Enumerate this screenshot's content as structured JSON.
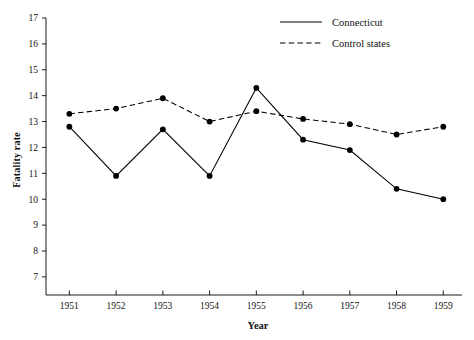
{
  "chart_data": {
    "type": "line",
    "title": "",
    "xlabel": "Year",
    "ylabel": "Fatality rate",
    "categories": [
      "1951",
      "1952",
      "1953",
      "1954",
      "1955",
      "1956",
      "1957",
      "1958",
      "1959"
    ],
    "x": [
      1951,
      1952,
      1953,
      1954,
      1955,
      1956,
      1957,
      1958,
      1959
    ],
    "xlim": [
      1950.5,
      1959.4
    ],
    "ylim": [
      6.3,
      17
    ],
    "yticks": [
      7,
      8,
      9,
      10,
      11,
      12,
      13,
      14,
      15,
      16,
      17
    ],
    "ytick_labels": [
      "7",
      "8",
      "9",
      "10",
      "11",
      "12",
      "13",
      "14",
      "15",
      "16",
      "17"
    ],
    "grid": false,
    "legend_position": "top-right",
    "series": [
      {
        "name": "Connecticut",
        "style": "solid",
        "marker": "filled-circle",
        "color": "#000000",
        "values": [
          12.8,
          10.9,
          12.7,
          10.9,
          14.3,
          12.3,
          11.9,
          10.4,
          10.0
        ]
      },
      {
        "name": "Control states",
        "style": "dashed",
        "marker": "filled-circle",
        "color": "#000000",
        "values": [
          13.3,
          13.5,
          13.9,
          13.0,
          13.4,
          13.1,
          12.9,
          12.5,
          12.8
        ]
      }
    ]
  },
  "legend": {
    "items": [
      {
        "label": "Connecticut",
        "style": "solid"
      },
      {
        "label": "Control states",
        "style": "dashed"
      }
    ]
  },
  "axis": {
    "x_title": "Year",
    "y_title": "Fatality rate"
  }
}
